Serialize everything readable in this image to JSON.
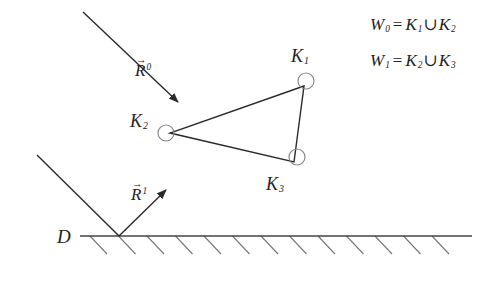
{
  "diagram": {
    "type": "physics-sketch",
    "colors": {
      "stroke": "#2a2a2a",
      "hatch": "#777777",
      "circle": "#888888",
      "text": "#222222",
      "background": "#ffffff"
    },
    "labels": {
      "surface": "D",
      "incident_vector": {
        "base": "R",
        "sup": "0",
        "arrow": "→"
      },
      "reflected_vector": {
        "base": "R",
        "sup": "1",
        "arrow": "→"
      },
      "k1": {
        "base": "K",
        "sub": "1"
      },
      "k2": {
        "base": "K",
        "sub": "2"
      },
      "k3": {
        "base": "K",
        "sub": "3"
      }
    },
    "equations": [
      {
        "lhs": "W",
        "lhs_sub": "0",
        "eq": "=",
        "a": "K",
        "a_sub": "1",
        "union": "∪",
        "b": "K",
        "b_sub": "2"
      },
      {
        "lhs": "W",
        "lhs_sub": "1",
        "eq": "=",
        "a": "K",
        "a_sub": "2",
        "union": "∪",
        "b": "K",
        "b_sub": "3"
      }
    ],
    "geometry": {
      "incident_line": {
        "x1": 83,
        "y1": 12,
        "x2": 178,
        "y2": 102
      },
      "triangle": [
        [
          304,
          86
        ],
        [
          170,
          133
        ],
        [
          294,
          162
        ]
      ],
      "circles": [
        {
          "name": "K1",
          "cx": 306,
          "cy": 81,
          "r": 8
        },
        {
          "name": "K2",
          "cx": 166,
          "cy": 133,
          "r": 8
        },
        {
          "name": "K3",
          "cx": 297,
          "cy": 157,
          "r": 8
        }
      ],
      "ground": {
        "x1": 80,
        "x2": 472,
        "y": 236
      },
      "reflection_point": {
        "x": 119,
        "y": 236
      },
      "incoming_ray_start": {
        "x": 37,
        "y": 155
      },
      "reflected_ray_end": {
        "x": 166,
        "y": 190
      },
      "hatch_count": 13,
      "hatch_start_x": 90,
      "hatch_spacing": 28.5,
      "hatch_dx": 17,
      "hatch_dy": 18
    }
  }
}
